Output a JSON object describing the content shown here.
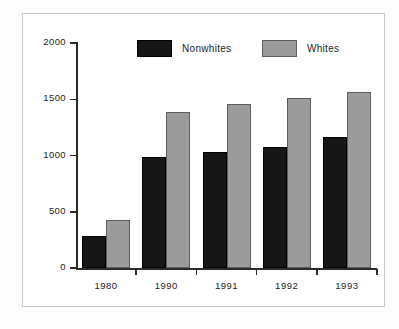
{
  "chart_data": {
    "type": "bar",
    "title": "",
    "subtitle": "",
    "xlabel": "",
    "ylabel": "",
    "categories": [
      "1980",
      "1990",
      "1991",
      "1992",
      "1993"
    ],
    "series": [
      {
        "name": "Nonwhites",
        "color": "#161616",
        "values": [
          285,
          985,
          1030,
          1080,
          1165
        ]
      },
      {
        "name": "Whites",
        "color": "#9b9b9b",
        "values": [
          430,
          1385,
          1455,
          1515,
          1565
        ]
      }
    ],
    "ylim": [
      0,
      2000
    ],
    "yticks": [
      0,
      500,
      1000,
      1500,
      2000
    ],
    "ytick_labels": [
      "0",
      "500",
      "1000",
      "1500",
      "2000"
    ],
    "grid": false,
    "legend_position": "top-center",
    "annotations": []
  },
  "legend": {
    "items": [
      {
        "label": "Nonwhites",
        "swatch": "legend-swatch-nonwhites"
      },
      {
        "label": "Whites",
        "swatch": "legend-swatch-whites"
      }
    ]
  },
  "axes": {
    "y_labels": [
      "2000",
      "1500",
      "1000",
      "500",
      "0"
    ],
    "x_labels": [
      "1980",
      "1990",
      "1991",
      "1992",
      "1993"
    ]
  }
}
